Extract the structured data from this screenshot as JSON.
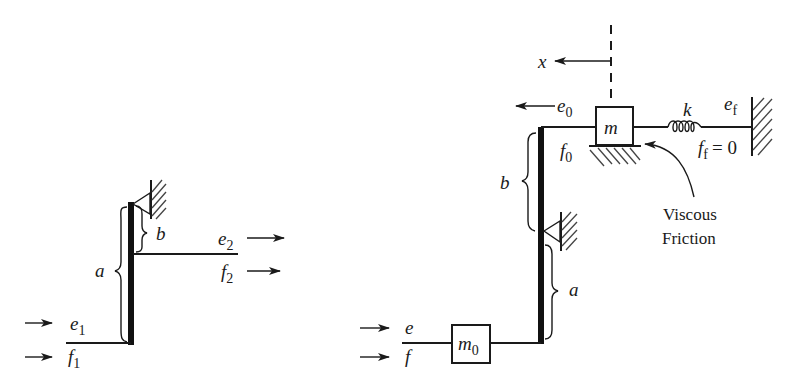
{
  "left_diagram": {
    "title": "Simple lever (transformer)",
    "labels": {
      "e1": {
        "base": "e",
        "sub": "1"
      },
      "f1": {
        "base": "f",
        "sub": "1"
      },
      "e2": {
        "base": "e",
        "sub": "2"
      },
      "f2": {
        "base": "f",
        "sub": "2"
      },
      "a": "a",
      "b": "b"
    }
  },
  "right_diagram": {
    "title": "Lever with mass, spring and viscous friction",
    "labels": {
      "x": "x",
      "e0": {
        "base": "e",
        "sub": "0"
      },
      "f0": {
        "base": "f",
        "sub": "0"
      },
      "m": "m",
      "k": "k",
      "ef": {
        "base": "e",
        "sub": "f"
      },
      "ff": {
        "base": "f",
        "sub": "f",
        "suffix": "= 0"
      },
      "b": "b",
      "a": "a",
      "e": "e",
      "f": "f",
      "m0": {
        "base": "m",
        "sub": "0"
      },
      "friction_line1": "Viscous",
      "friction_line2": "Friction"
    }
  },
  "colors": {
    "ink": "#1a1a1a",
    "background": "#ffffff"
  }
}
